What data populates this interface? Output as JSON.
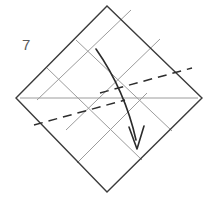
{
  "diagram": {
    "step_number": "7",
    "shape": {
      "name": "square-rotated-45",
      "vertices": {
        "top": [
          107,
          6
        ],
        "right": [
          202,
          98
        ],
        "bottom": [
          107,
          192
        ],
        "left": [
          16,
          98
        ]
      },
      "outline_color": "#3b3b3b"
    },
    "colors": {
      "outline": "#3b3b3b",
      "crease": "#9c9c9c",
      "valley_dashed": "#2d2d2d",
      "arrow": "#2b2b2b",
      "step_label": "#5a5a5a",
      "background": "#ffffff"
    },
    "creases": [
      {
        "name": "horizontal-center-crease",
        "x1": 20,
        "y1": 98,
        "x2": 198,
        "y2": 98
      },
      {
        "name": "crease-parallel-upper-left-edge-a",
        "x1": 47,
        "y1": 68,
        "x2": 142,
        "y2": 160
      },
      {
        "name": "crease-parallel-upper-left-edge-b",
        "x1": 76,
        "y1": 40,
        "x2": 172,
        "y2": 131
      },
      {
        "name": "crease-parallel-upper-right-edge-a",
        "x1": 66,
        "y1": 130,
        "x2": 160,
        "y2": 39
      },
      {
        "name": "crease-parallel-upper-right-edge-b",
        "x1": 37,
        "y1": 100,
        "x2": 131,
        "y2": 10
      },
      {
        "name": "crease-parallel-lower-left-edge",
        "x1": 77,
        "y1": 163,
        "x2": 147,
        "y2": 93
      }
    ],
    "fold_lines": [
      {
        "name": "valley-fold-upper-right",
        "type": "dashed",
        "x1": 100,
        "y1": 93,
        "x2": 192,
        "y2": 68,
        "dash_pattern": "9,6"
      },
      {
        "name": "valley-fold-lower-left",
        "type": "dashed",
        "x1": 34,
        "y1": 125,
        "x2": 125,
        "y2": 100,
        "dash_pattern": "9,6"
      }
    ],
    "arrow": {
      "name": "fold-direction-arrow",
      "type": "curved-arrow",
      "start": [
        96,
        49
      ],
      "control": [
        118,
        92
      ],
      "end": [
        136,
        140
      ],
      "head_tip": [
        137,
        148
      ],
      "description": "curved arrow pointing downward indicating fold direction"
    }
  }
}
